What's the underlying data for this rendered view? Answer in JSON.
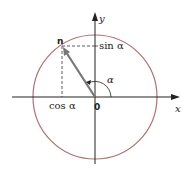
{
  "diagram": {
    "type": "unit-circle",
    "labels": {
      "x_axis": "x",
      "y_axis": "y",
      "origin": "0",
      "point": "n",
      "sin": "sin α",
      "cos": "cos α",
      "angle": "α"
    },
    "colors": {
      "circle": "#b07070",
      "vector": "#777777",
      "axes": "#222222"
    }
  }
}
